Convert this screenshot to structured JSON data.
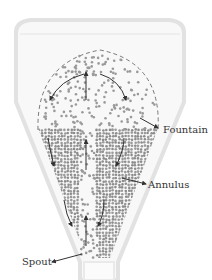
{
  "diagram": {
    "type": "spouted-bed-schematic",
    "regions": [
      {
        "id": "fountain",
        "label": "Fountain"
      },
      {
        "id": "annulus",
        "label": "Annulus"
      },
      {
        "id": "spout",
        "label": "Spout"
      }
    ],
    "colors": {
      "vessel_wall": "#e4e4e4",
      "vessel_fill": "#f7f7f7",
      "particle": "#9a9a9a",
      "particle_dense": "#8c8c8c",
      "arrow": "#333333",
      "fountain_outline": "#777777",
      "label_text": "#333333"
    }
  }
}
